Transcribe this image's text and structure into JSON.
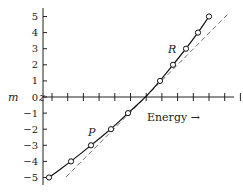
{
  "chart_data": {
    "type": "line",
    "title": "",
    "xlabel": "Energy →",
    "ylabel": "m",
    "ylim": [
      -5,
      5
    ],
    "y_ticks": [
      "5",
      "4",
      "3",
      "2",
      "1",
      "0",
      "-1",
      "-2",
      "-3",
      "-4",
      "-5"
    ],
    "x_tick_count": 13,
    "series": [
      {
        "name": "measured",
        "style": "solid",
        "marker": "circle",
        "m": [
          -5,
          -4,
          -3,
          -2,
          -1,
          1,
          2,
          3,
          4,
          5
        ],
        "x_px": [
          49,
          71,
          91,
          111,
          128,
          160,
          173,
          186,
          198,
          209
        ]
      },
      {
        "name": "linear reference",
        "style": "dashed"
      }
    ],
    "annotations": [
      {
        "text": "P",
        "near_m": -2.5
      },
      {
        "text": "R",
        "near_m": 2.5
      },
      {
        "text": "z",
        "at": "origin"
      }
    ]
  }
}
